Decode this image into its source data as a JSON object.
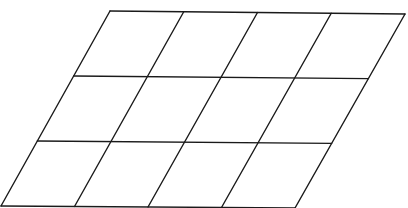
{
  "diagram": {
    "type": "parallelogram-grid",
    "columns": 4,
    "rows": 3,
    "stroke_color": "#1a1a1a",
    "background": "#ffffff",
    "corners": {
      "top_left": [
        110,
        11
      ],
      "top_right": [
        405,
        14
      ],
      "bottom_left": [
        1,
        206
      ],
      "bottom_right": [
        295,
        208
      ]
    }
  }
}
